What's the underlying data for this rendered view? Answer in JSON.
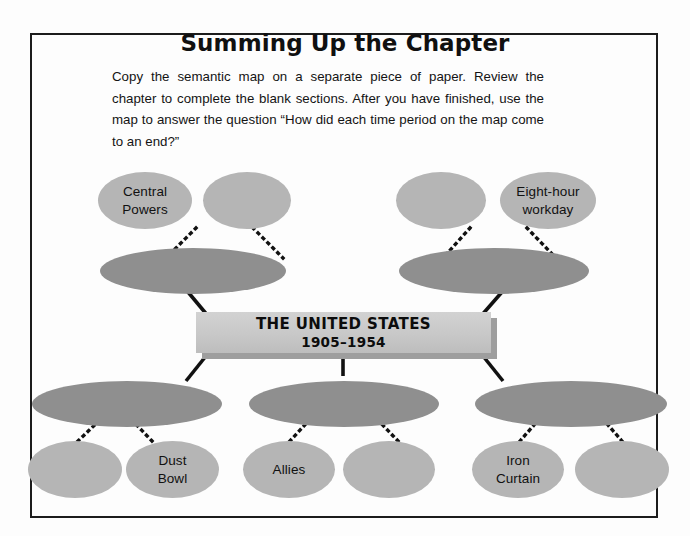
{
  "page": {
    "title": "Summing Up the Chapter",
    "intro": "Copy the semantic map on a separate piece of paper. Review the chapter to complete the blank sections. After you have finished, use the map to answer the question “How did each time period on the map come to an end?”"
  },
  "center_box": {
    "line1": "THE UNITED STATES",
    "line2": "1905–1954"
  },
  "colors": {
    "node_light": "#b5b5b5",
    "node_dark": "#8f8f8f",
    "box_fill": "#c8c8c8",
    "box_shadow": "#9e9e9e",
    "frame_border": "#1c1c1c",
    "text": "#111111",
    "page_background": "#fdfdfd"
  },
  "diagram": {
    "type": "semantic-map",
    "top_leaf_nodes": [
      {
        "label": "Central\nPowers",
        "filled": true,
        "shade": "light"
      },
      {
        "label": "",
        "filled": false,
        "shade": "light"
      },
      {
        "label": "",
        "filled": false,
        "shade": "light"
      },
      {
        "label": "Eight-hour\nworkday",
        "filled": true,
        "shade": "light"
      }
    ],
    "top_branch_nodes": [
      {
        "label": "",
        "filled": false,
        "shade": "dark"
      },
      {
        "label": "",
        "filled": false,
        "shade": "dark"
      }
    ],
    "bottom_branch_nodes": [
      {
        "label": "",
        "filled": false,
        "shade": "dark"
      },
      {
        "label": "",
        "filled": false,
        "shade": "dark"
      },
      {
        "label": "",
        "filled": false,
        "shade": "dark"
      }
    ],
    "bottom_leaf_nodes": [
      {
        "label": "",
        "filled": false,
        "shade": "light"
      },
      {
        "label": "Dust\nBowl",
        "filled": true,
        "shade": "light"
      },
      {
        "label": "Allies",
        "filled": true,
        "shade": "light"
      },
      {
        "label": "",
        "filled": false,
        "shade": "light"
      },
      {
        "label": "Iron\nCurtain",
        "filled": true,
        "shade": "light"
      },
      {
        "label": "",
        "filled": false,
        "shade": "light"
      }
    ],
    "connectors": {
      "leaf_style": "dotted",
      "branch_style": "solid"
    }
  }
}
